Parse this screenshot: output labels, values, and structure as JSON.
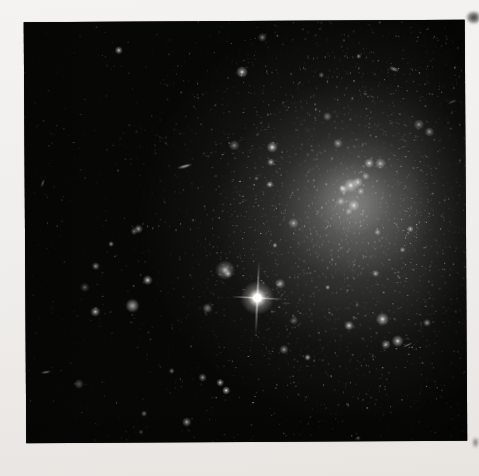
{
  "meta": {
    "visible_text": ""
  },
  "page": {
    "width": 479,
    "height": 476,
    "paper_color_top": "#f4f3f1",
    "paper_color_bottom": "#e8e5e1"
  },
  "photo": {
    "left": 25,
    "top": 21,
    "width": 441,
    "height": 421,
    "rotation_deg": -0.35,
    "sky_color": "#070706",
    "galaxy": {
      "center_x": 328,
      "center_y": 192,
      "glow_color": "210,210,205",
      "glows": [
        {
          "x": 328,
          "y": 196,
          "rx": 215,
          "ry": 205,
          "alpha": 0.16
        },
        {
          "x": 330,
          "y": 192,
          "rx": 140,
          "ry": 135,
          "alpha": 0.22
        },
        {
          "x": 330,
          "y": 186,
          "rx": 78,
          "ry": 74,
          "alpha": 0.26
        },
        {
          "x": 327,
          "y": 178,
          "rx": 40,
          "ry": 38,
          "alpha": 0.22
        }
      ],
      "knots": [
        {
          "x": 326,
          "y": 165,
          "r": 3.0,
          "alpha": 0.95
        },
        {
          "x": 333,
          "y": 162,
          "r": 2.2,
          "alpha": 0.85
        },
        {
          "x": 319,
          "y": 169,
          "r": 2.0,
          "alpha": 0.75
        },
        {
          "x": 336,
          "y": 171,
          "r": 1.6,
          "alpha": 0.7
        },
        {
          "x": 316,
          "y": 181,
          "r": 1.8,
          "alpha": 0.7
        },
        {
          "x": 329,
          "y": 185,
          "r": 2.4,
          "alpha": 0.85
        },
        {
          "x": 324,
          "y": 191,
          "r": 1.5,
          "alpha": 0.65
        },
        {
          "x": 341,
          "y": 156,
          "r": 1.6,
          "alpha": 0.7
        }
      ]
    },
    "star_field": {
      "seed": 1337,
      "cluster": {
        "count": 2300,
        "sigma_x": 95,
        "sigma_y": 105,
        "min_size": 0.5,
        "max_size": 1.3
      },
      "halo": {
        "count": 1500,
        "sigma_x": 155,
        "sigma_y": 140,
        "min_size": 0.5,
        "max_size": 1.1
      },
      "uniform": {
        "count": 520,
        "min_size": 0.5,
        "max_size": 1.0
      },
      "medium_cluster_count": 46,
      "medium_uniform_count": 14,
      "grain_count": 2600
    },
    "bright_star": {
      "x": 232,
      "y": 277,
      "core_radius": 4.5,
      "halo_radius": 17,
      "spike_tilt_deg": 3,
      "spike_half_v": 37,
      "spike_half_h": 26,
      "spike_width": 1.6
    },
    "fuzzy_star": {
      "x": 200,
      "y": 249,
      "r": 5,
      "alpha": 0.75
    },
    "objects": [
      {
        "kind": "streak",
        "x": 160,
        "y": 145,
        "len": 16,
        "w": 3.5,
        "angle": -15,
        "alpha": 0.8
      },
      {
        "kind": "streak",
        "x": 18,
        "y": 161,
        "len": 9,
        "w": 2.5,
        "angle": -70,
        "alpha": 0.6
      },
      {
        "kind": "blob",
        "x": 107,
        "y": 284,
        "r": 3.5,
        "alpha": 0.7
      },
      {
        "kind": "blob",
        "x": 182,
        "y": 287,
        "r": 2.5,
        "alpha": 0.5
      },
      {
        "kind": "streak",
        "x": 20,
        "y": 350,
        "len": 11,
        "w": 3,
        "angle": -10,
        "alpha": 0.6
      },
      {
        "kind": "blob",
        "x": 53,
        "y": 362,
        "r": 2.5,
        "alpha": 0.35
      },
      {
        "kind": "streak",
        "x": 370,
        "y": 49,
        "len": 11,
        "w": 5,
        "angle": 20,
        "alpha": 0.55
      },
      {
        "kind": "streak",
        "x": 428,
        "y": 82,
        "len": 10,
        "w": 2.5,
        "angle": -25,
        "alpha": 0.5
      },
      {
        "kind": "streak",
        "x": 382,
        "y": 325,
        "len": 12,
        "w": 2,
        "angle": -25,
        "alpha": 0.5
      },
      {
        "kind": "blob",
        "x": 118,
        "y": 392,
        "r": 1.5,
        "alpha": 0.5
      },
      {
        "kind": "star",
        "x": 218,
        "y": 51,
        "r": 2.0,
        "alpha": 0.9
      },
      {
        "kind": "star",
        "x": 357,
        "y": 299,
        "r": 2.2,
        "alpha": 0.95
      },
      {
        "kind": "star",
        "x": 372,
        "y": 321,
        "r": 2.0,
        "alpha": 0.9
      },
      {
        "kind": "star",
        "x": 405,
        "y": 112,
        "r": 1.6,
        "alpha": 0.7
      },
      {
        "kind": "blob",
        "x": 303,
        "y": 96,
        "r": 2.2,
        "alpha": 0.45
      }
    ],
    "vignette": {
      "right_alpha": 0.35,
      "bottom_alpha": 0.22,
      "left_alpha": 0.18
    }
  },
  "artifacts": [
    {
      "name": "top-right",
      "left": 466,
      "top": 11,
      "width": 13,
      "height": 13
    },
    {
      "name": "bottom-right",
      "left": 472,
      "top": 437,
      "width": 7,
      "height": 11
    }
  ]
}
